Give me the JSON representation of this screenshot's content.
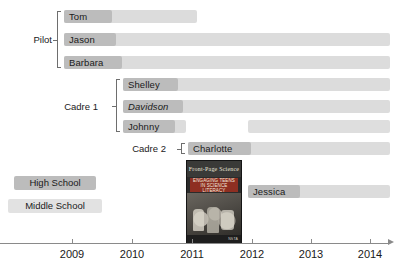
{
  "chart_data": {
    "type": "bar",
    "title": "",
    "xlabel": "",
    "ylabel": "",
    "grid": false,
    "orientation": "horizontal",
    "axis": {
      "ticks": [
        "2009",
        "2010",
        "2011",
        "2012",
        "2013",
        "2014"
      ],
      "tick_values": [
        2009,
        2010,
        2011,
        2012,
        2013,
        2014
      ],
      "xlim": [
        2008.0,
        2014.5
      ],
      "arrow_end": true
    },
    "legend": {
      "position": "left-middle",
      "entries": [
        {
          "label": "High School",
          "color": "#bcbcbc"
        },
        {
          "label": "Middle School",
          "color": "#e2e2e2"
        }
      ]
    },
    "groups": [
      {
        "name": "Pilot",
        "members": [
          {
            "name": "Tom",
            "italic": false,
            "segments": [
              {
                "start": 2008.15,
                "end": 2011.08
              }
            ]
          },
          {
            "name": "Jason",
            "italic": false,
            "segments": [
              {
                "start": 2008.15,
                "end": 2014.3
              }
            ]
          },
          {
            "name": "Barbara",
            "italic": false,
            "segments": [
              {
                "start": 2008.15,
                "end": 2014.3
              }
            ]
          }
        ]
      },
      {
        "name": "Cadre 1",
        "members": [
          {
            "name": "Shelley",
            "italic": false,
            "segments": [
              {
                "start": 2009.15,
                "end": 2014.3
              }
            ]
          },
          {
            "name": "Davidson",
            "italic": true,
            "segments": [
              {
                "start": 2009.15,
                "end": 2014.3
              }
            ]
          },
          {
            "name": "Johnny",
            "italic": false,
            "segments": [
              {
                "start": 2009.15,
                "end": 2010.2
              },
              {
                "start": 2011.05,
                "end": 2014.3
              }
            ]
          }
        ]
      },
      {
        "name": "Cadre 2",
        "members": [
          {
            "name": "Charlotte",
            "italic": false,
            "segments": [
              {
                "start": 2010.95,
                "end": 2014.3
              }
            ]
          }
        ]
      },
      {
        "name": "",
        "members": [
          {
            "name": "Jessica",
            "italic": false,
            "segments": [
              {
                "start": 2011.95,
                "end": 2014.3
              }
            ]
          }
        ]
      }
    ],
    "annotations": [
      {
        "type": "book-cover",
        "at": 2011.45,
        "masthead": "Front-Page Science",
        "title": "ENGAGING TEENS IN SCIENCE LITERACY",
        "publisher": "NSTA"
      }
    ]
  },
  "rows": [
    {
      "label": "Tom",
      "italic": false,
      "chip_w": 48,
      "bar_x": 64,
      "bar_w": 133,
      "y": 10,
      "seg2_x": null,
      "seg2_w": null
    },
    {
      "label": "Jason",
      "italic": false,
      "chip_w": 52,
      "bar_x": 64,
      "bar_w": 326,
      "y": 33,
      "seg2_x": null,
      "seg2_w": null
    },
    {
      "label": "Barbara",
      "italic": false,
      "chip_w": 58,
      "bar_x": 64,
      "bar_w": 326,
      "y": 56,
      "seg2_x": null,
      "seg2_w": null
    },
    {
      "label": "Shelley",
      "italic": false,
      "chip_w": 55,
      "bar_x": 123,
      "bar_w": 267,
      "y": 78,
      "seg2_x": null,
      "seg2_w": null
    },
    {
      "label": "Davidson",
      "italic": true,
      "chip_w": 60,
      "bar_x": 123,
      "bar_w": 267,
      "y": 100,
      "seg2_x": null,
      "seg2_w": null
    },
    {
      "label": "Johnny",
      "italic": false,
      "chip_w": 52,
      "bar_x": 123,
      "bar_w": 63,
      "y": 120,
      "seg2_x": 248,
      "seg2_w": 142
    },
    {
      "label": "Charlotte",
      "italic": false,
      "chip_w": 63,
      "bar_x": 188,
      "bar_w": 202,
      "y": 142,
      "seg2_x": null,
      "seg2_w": null
    },
    {
      "label": "Jessica",
      "italic": false,
      "chip_w": 52,
      "bar_x": 248,
      "bar_w": 142,
      "y": 185,
      "seg2_x": null,
      "seg2_w": null
    }
  ],
  "group_labels": [
    {
      "text": "Pilot",
      "x": 10,
      "y": 33,
      "w": 42
    },
    {
      "text": "Cadre 1",
      "x": 50,
      "y": 100,
      "w": 48
    },
    {
      "text": "Cadre 2",
      "x": 118,
      "y": 142,
      "w": 48
    }
  ],
  "brackets": [
    {
      "x": 57,
      "y": 11,
      "h": 57
    },
    {
      "x": 116,
      "y": 79,
      "h": 53
    },
    {
      "x": 181,
      "y": 143,
      "h": 11
    }
  ],
  "legend": {
    "high_school": "High School",
    "middle_school": "Middle School",
    "hs_x": 14,
    "hs_y": 176,
    "hs_w": 82,
    "ms_x": 8,
    "ms_y": 199,
    "ms_w": 94
  },
  "axis": {
    "ticks": [
      {
        "label": "2009",
        "x": 72
      },
      {
        "label": "2010",
        "x": 132
      },
      {
        "label": "2011",
        "x": 192
      },
      {
        "label": "2012",
        "x": 252
      },
      {
        "label": "2013",
        "x": 311
      },
      {
        "label": "2014",
        "x": 370
      }
    ]
  },
  "book": {
    "masthead": "Front-Page Science",
    "title": "ENGAGING TEENS IN SCIENCE LITERACY",
    "publisher": "NSTA"
  }
}
